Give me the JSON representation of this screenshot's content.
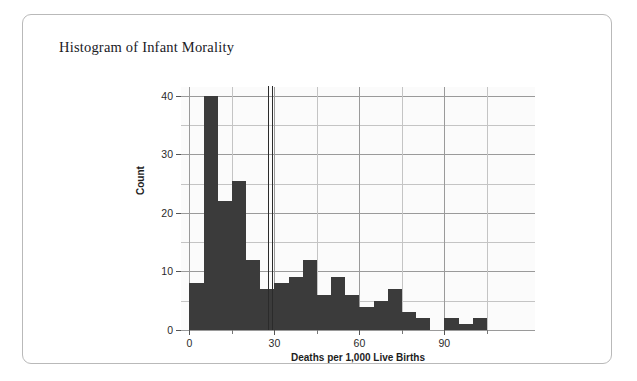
{
  "card": {
    "title": "Histogram of Infant Morality"
  },
  "chart_data": {
    "type": "bar",
    "title": "Histogram of Infant Morality",
    "xlabel": "Deaths per 1,000 Live Births",
    "ylabel": "Count",
    "xlim": [
      -3,
      122
    ],
    "ylim": [
      0,
      41.5
    ],
    "grid": true,
    "legend": null,
    "bin_width": 5,
    "x_major_ticks": [
      0,
      30,
      60,
      90
    ],
    "x_major_tick_labels": [
      "0",
      "30",
      "60",
      "90"
    ],
    "x_minor_ticks": [
      15,
      45,
      75,
      105
    ],
    "y_major_ticks": [
      0,
      10,
      20,
      30,
      40
    ],
    "y_major_tick_labels": [
      "0",
      "10",
      "20",
      "30",
      "40"
    ],
    "y_minor_ticks": [
      5,
      15,
      25,
      35
    ],
    "bin_starts": [
      0,
      5,
      10,
      15,
      20,
      25,
      30,
      35,
      40,
      45,
      50,
      55,
      60,
      65,
      70,
      75,
      80,
      85,
      90,
      95,
      100,
      105
    ],
    "values": [
      8,
      40,
      22,
      25.5,
      12,
      7,
      8,
      9,
      12,
      6,
      9,
      6,
      4,
      5,
      7,
      3,
      2,
      0,
      2,
      1,
      2,
      0
    ],
    "annotations": [
      {
        "type": "vline",
        "x": 27.6,
        "label": ""
      },
      {
        "type": "vline",
        "x": 29.3,
        "label": ""
      }
    ],
    "colors": {
      "bar": "#3b3b3b",
      "grid_major": "#9a9a9a",
      "grid_minor": "#c4c4c4",
      "panel_background": "#fbfbfb",
      "vline": "#2b2b2b",
      "text": "#20201f"
    }
  }
}
